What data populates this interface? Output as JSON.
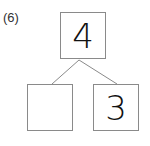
{
  "problem_label": "(6)",
  "diagram": {
    "top_value": "4",
    "left_value": "",
    "right_value": "3"
  }
}
